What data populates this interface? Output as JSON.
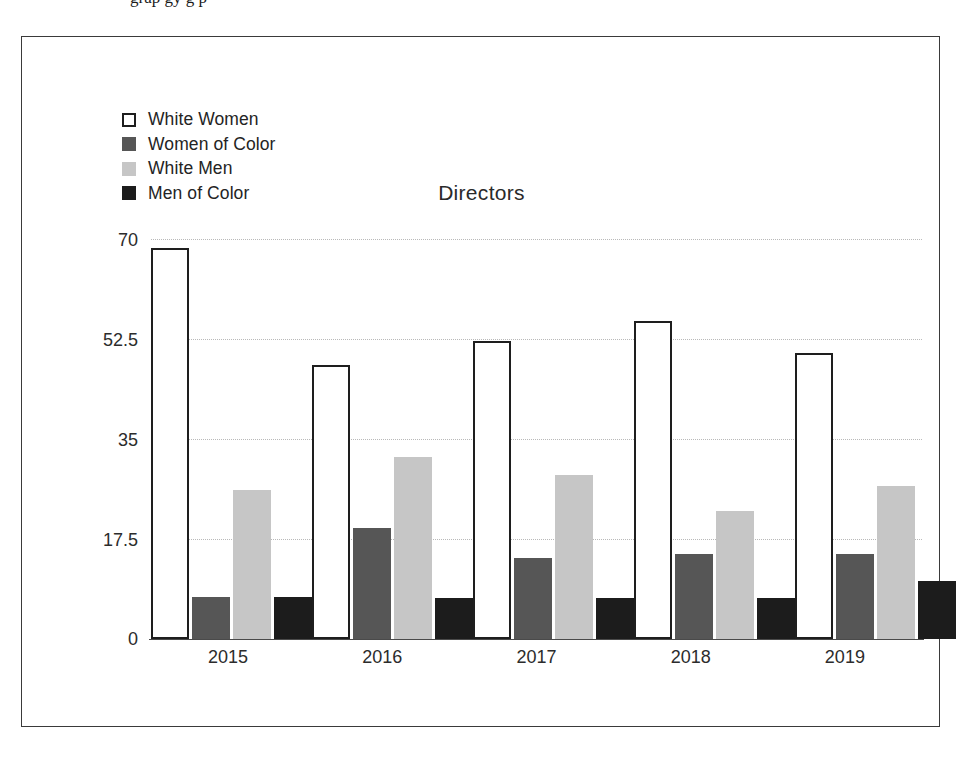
{
  "page": {
    "top_cropped_text": "grap gy g p"
  },
  "chart_data": {
    "type": "bar",
    "title": "Directors",
    "xlabel": "",
    "ylabel": "",
    "categories": [
      "2015",
      "2016",
      "2017",
      "2018",
      "2019"
    ],
    "series": [
      {
        "name": "White Women",
        "color": "#ffffff",
        "edge_color": "#1e1e1e",
        "values": [
          68.4,
          48.0,
          52.2,
          55.7,
          50.0
        ]
      },
      {
        "name": "Women of Color",
        "color": "#565656",
        "edge_color": "#565656",
        "values": [
          7.4,
          19.4,
          14.2,
          14.9,
          14.9
        ]
      },
      {
        "name": "White Men",
        "color": "#c6c6c6",
        "edge_color": "#c6c6c6",
        "values": [
          26.1,
          31.9,
          28.7,
          22.4,
          26.8
        ]
      },
      {
        "name": "Men of Color",
        "color": "#1c1c1c",
        "edge_color": "#1c1c1c",
        "values": [
          7.4,
          7.2,
          7.2,
          7.2,
          10.2
        ]
      }
    ],
    "ylim": [
      0,
      70
    ],
    "yticks": [
      0,
      17.5,
      35,
      52.5,
      70
    ],
    "ytick_labels": [
      "0",
      "17.5",
      "35",
      "52.5",
      "70"
    ],
    "grid": true,
    "grid_axis": "y",
    "legend_position": "upper left"
  }
}
